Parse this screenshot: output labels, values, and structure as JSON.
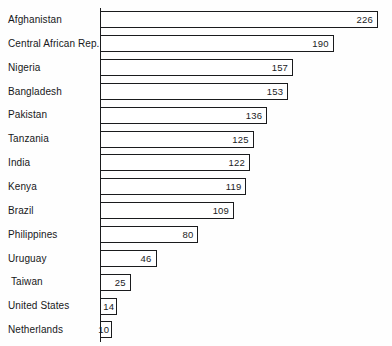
{
  "chart_data": {
    "type": "bar",
    "orientation": "horizontal",
    "title": "",
    "subtitle": "",
    "xlabel": "",
    "ylabel": "",
    "xlim": [
      0,
      226
    ],
    "grid": false,
    "legend": null,
    "axis_ticks": [],
    "categories": [
      "Afghanistan",
      "Central African Rep.",
      "Nigeria",
      "Bangladesh",
      "Pakistan",
      "Tanzania",
      "India",
      "Kenya",
      "Brazil",
      "Philippines",
      "Uruguay",
      "Taiwan",
      "United States",
      "Netherlands"
    ],
    "values": [
      226,
      190,
      157,
      153,
      136,
      125,
      122,
      119,
      109,
      80,
      46,
      25,
      14,
      10
    ],
    "value_labels": [
      "226",
      "190",
      "157",
      "153",
      "136",
      "125",
      "122",
      "119",
      "109",
      "80",
      "46",
      "25",
      "14",
      "10"
    ],
    "series": [
      {
        "name": "",
        "values": [
          226,
          190,
          157,
          153,
          136,
          125,
          122,
          119,
          109,
          80,
          46,
          25,
          14,
          10
        ]
      }
    ]
  },
  "style": {
    "bar_fill": "#ffffff",
    "bar_border": "#1a1b1d",
    "text_color": "#17181a",
    "background": "#fefefe"
  },
  "geometry": {
    "bar_origin_x": 100,
    "bar_max_x": 378,
    "plot_top": 8,
    "row_pitch": 23.85,
    "bar_height": 17
  }
}
